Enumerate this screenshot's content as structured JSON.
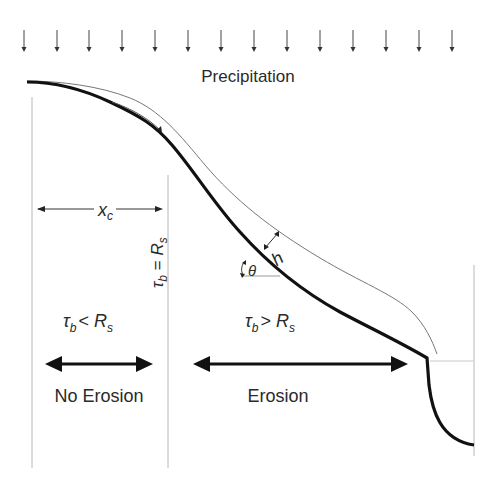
{
  "diagram": {
    "title_label": "Precipitation",
    "precipitation_arrows_count": 14,
    "labels": {
      "critical_distance": "x",
      "critical_distance_sub": "c",
      "threshold_tau": "τ",
      "threshold_tau_sub": "b",
      "threshold_eq": " = ",
      "threshold_R": "R",
      "threshold_R_sub": "s",
      "left_tau": "τ",
      "left_tau_sub": "b",
      "left_op": "< ",
      "left_R": "R",
      "left_R_sub": "s",
      "right_tau": "τ",
      "right_tau_sub": "b",
      "right_op": "> ",
      "right_R": "R",
      "right_R_sub": "s",
      "flow_depth": "h",
      "slope_angle": "θ",
      "no_erosion": "No Erosion",
      "erosion": "Erosion"
    },
    "colors": {
      "bed_line": "#111111",
      "water_surface": "#777777",
      "guide_lines": "#b8b8b8",
      "text": "#2a2a2a"
    }
  }
}
